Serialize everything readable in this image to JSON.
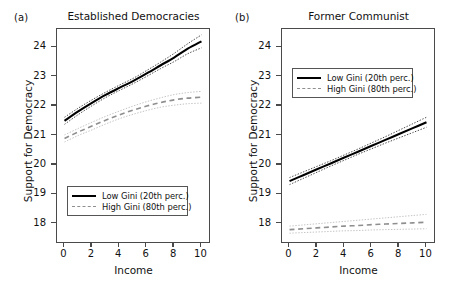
{
  "figure": {
    "axis_title_x": "Income",
    "axis_title_y": "Support for Democracy"
  },
  "panels": [
    {
      "label": "(a)",
      "title": "Established Democracies",
      "legend_position": "bottom-left",
      "legend": [
        {
          "key": "solid-line",
          "text": "Low Gini (20th perc.)"
        },
        {
          "key": "dashed-line",
          "text": "High Gini (80th perc.)"
        }
      ]
    },
    {
      "label": "(b)",
      "title": "Former Communist",
      "legend_position": "top-left",
      "legend": [
        {
          "key": "solid-line",
          "text": "Low Gini (20th perc.)"
        },
        {
          "key": "dashed-line",
          "text": "High Gini (80th perc.)"
        }
      ]
    }
  ],
  "ticks": {
    "y": [
      "24",
      "23",
      "22",
      "21",
      "20",
      "19",
      "18"
    ],
    "x": [
      "0",
      "2",
      "4",
      "6",
      "8",
      "10"
    ]
  },
  "chart_data": {
    "type": "line",
    "xlabel": "Income",
    "ylabel": "Support for Democracy",
    "xlim": [
      -0.55,
      10.55
    ],
    "ylim": [
      17.38,
      24.62
    ],
    "xticks": [
      0,
      2,
      4,
      6,
      8,
      10
    ],
    "yticks": [
      18,
      19,
      20,
      21,
      22,
      23,
      24
    ],
    "grid": false,
    "legend_entries": [
      "Low Gini (20th perc.)",
      "High Gini (80th perc.)"
    ],
    "panels": [
      {
        "name": "(a) Established Democracies",
        "x": [
          0,
          1,
          2,
          3,
          4,
          5,
          6,
          7,
          8,
          9,
          10
        ],
        "series": [
          {
            "name": "Low Gini (20th perc.)",
            "style": "solid",
            "color": "#000000",
            "values": [
              21.5,
              21.82,
              22.11,
              22.38,
              22.62,
              22.85,
              23.11,
              23.38,
              23.65,
              23.95,
              24.2
            ],
            "ci_upper": [
              21.62,
              21.93,
              22.21,
              22.47,
              22.71,
              22.94,
              23.21,
              23.49,
              23.79,
              24.12,
              24.42
            ],
            "ci_lower": [
              21.38,
              21.71,
              22.01,
              22.29,
              22.53,
              22.76,
              23.01,
              23.27,
              23.51,
              23.78,
              23.98
            ]
          },
          {
            "name": "High Gini (80th perc.)",
            "style": "dashed",
            "color": "#8f8f8f",
            "values": [
              20.9,
              21.12,
              21.32,
              21.52,
              21.7,
              21.86,
              22.0,
              22.12,
              22.21,
              22.27,
              22.3
            ],
            "ci_upper": [
              21.02,
              21.24,
              21.45,
              21.65,
              21.83,
              22.0,
              22.15,
              22.28,
              22.39,
              22.46,
              22.5
            ],
            "ci_lower": [
              20.78,
              21.0,
              21.19,
              21.39,
              21.57,
              21.72,
              21.85,
              21.96,
              22.03,
              22.08,
              22.1
            ]
          }
        ]
      },
      {
        "name": "(b) Former Communist",
        "x": [
          0,
          1,
          2,
          3,
          4,
          5,
          6,
          7,
          8,
          9,
          10
        ],
        "series": [
          {
            "name": "Low Gini (20th perc.)",
            "style": "solid",
            "color": "#000000",
            "values": [
              19.45,
              19.65,
              19.85,
              20.05,
              20.25,
              20.45,
              20.65,
              20.85,
              21.05,
              21.25,
              21.45
            ],
            "ci_upper": [
              19.57,
              19.76,
              19.95,
              20.14,
              20.34,
              20.54,
              20.75,
              20.96,
              21.18,
              21.4,
              21.62
            ],
            "ci_lower": [
              19.33,
              19.54,
              19.75,
              19.96,
              20.16,
              20.36,
              20.55,
              20.74,
              20.92,
              21.1,
              21.28
            ]
          },
          {
            "name": "High Gini (80th perc.)",
            "style": "dashed",
            "color": "#8f8f8f",
            "values": [
              17.8,
              17.83,
              17.86,
              17.89,
              17.92,
              17.94,
              17.97,
              17.99,
              18.01,
              18.03,
              18.05
            ],
            "ci_upper": [
              17.92,
              17.96,
              18.0,
              18.04,
              18.08,
              18.12,
              18.16,
              18.2,
              18.24,
              18.28,
              18.32
            ],
            "ci_lower": [
              17.68,
              17.7,
              17.72,
              17.74,
              17.76,
              17.77,
              17.79,
              17.8,
              17.81,
              17.82,
              17.83
            ]
          }
        ]
      }
    ]
  }
}
